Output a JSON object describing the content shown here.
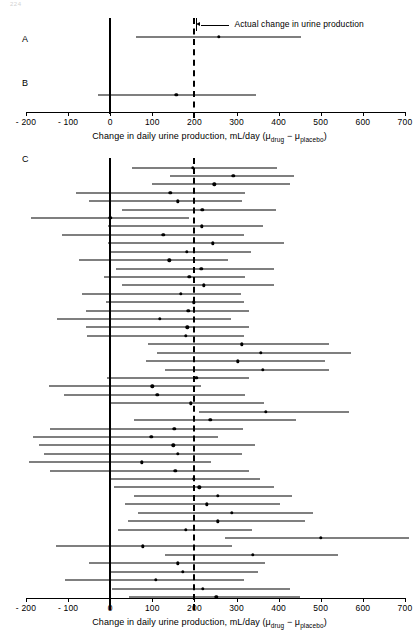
{
  "page": {
    "number": "224"
  },
  "axis": {
    "title_main": "Change in daily urine production, mL/day (",
    "title_mu1": "μ",
    "title_sub1": "drug",
    "title_minus": " − ",
    "title_mu2": "μ",
    "title_sub2": "placebo",
    "title_close": ")",
    "min": -200,
    "max": 700,
    "ticks": [
      -200,
      -100,
      0,
      100,
      200,
      300,
      400,
      500,
      600,
      700
    ],
    "tick_labels": [
      "- 200",
      "- 100",
      "0",
      "100",
      "200",
      "300",
      "400",
      "500",
      "600",
      "700"
    ],
    "unit": "mL/day"
  },
  "reference_lines": {
    "zero_value": 0,
    "zero_style": "solid",
    "true_value": 200,
    "true_style": "dashed"
  },
  "annotation": {
    "label": "Actual change in urine production",
    "points_to": 200
  },
  "panels": [
    {
      "id": "A",
      "label": "A"
    },
    {
      "id": "B",
      "label": "B"
    },
    {
      "id": "C",
      "label": "C"
    }
  ],
  "chart_data": {
    "type": "scatter",
    "title": "",
    "xlabel": "Change in daily urine production, mL/day (μ_drug − μ_placebo)",
    "ylabel": "",
    "xlim": [
      -200,
      700
    ],
    "grid": false,
    "legend": "none",
    "reference_line_solid": 0,
    "reference_line_dashed": 200,
    "annotation_text": "Actual change in urine production",
    "panels": [
      {
        "panel": "A",
        "note": "single sample confidence interval",
        "intervals": [
          {
            "mean": 258,
            "low": 62,
            "high": 452
          }
        ]
      },
      {
        "panel": "B",
        "note": "single sample confidence interval",
        "intervals": [
          {
            "mean": 157,
            "low": -28,
            "high": 346
          }
        ]
      },
      {
        "panel": "C",
        "note": "many repeated samples, each 95% confidence interval",
        "intervals": [
          {
            "mean": 196,
            "low": 52,
            "high": 396
          },
          {
            "mean": 292,
            "low": 142,
            "high": 436
          },
          {
            "mean": 247,
            "low": 100,
            "high": 428
          },
          {
            "mean": 143,
            "low": -82,
            "high": 320
          },
          {
            "mean": 160,
            "low": -50,
            "high": 312
          },
          {
            "mean": 219,
            "low": 28,
            "high": 394
          },
          {
            "mean": 0,
            "low": -188,
            "high": 186
          },
          {
            "mean": 217,
            "low": -6,
            "high": 364
          },
          {
            "mean": 126,
            "low": -115,
            "high": 318
          },
          {
            "mean": 244,
            "low": -6,
            "high": 412
          },
          {
            "mean": 182,
            "low": 0,
            "high": 335
          },
          {
            "mean": 140,
            "low": -74,
            "high": 280
          },
          {
            "mean": 216,
            "low": 13,
            "high": 390
          },
          {
            "mean": 188,
            "low": -15,
            "high": 320
          },
          {
            "mean": 222,
            "low": 29,
            "high": 388
          },
          {
            "mean": 168,
            "low": -66,
            "high": 310
          },
          {
            "mean": 199,
            "low": -11,
            "high": 318
          },
          {
            "mean": 185,
            "low": -58,
            "high": 330
          },
          {
            "mean": 118,
            "low": -126,
            "high": 288
          },
          {
            "mean": 183,
            "low": -58,
            "high": 330
          },
          {
            "mean": 180,
            "low": -56,
            "high": 318
          },
          {
            "mean": 312,
            "low": 90,
            "high": 520
          },
          {
            "mean": 358,
            "low": 110,
            "high": 572
          },
          {
            "mean": 303,
            "low": 85,
            "high": 510
          },
          {
            "mean": 362,
            "low": 130,
            "high": 520
          },
          {
            "mean": 204,
            "low": -7,
            "high": 330
          },
          {
            "mean": 100,
            "low": -145,
            "high": 216
          },
          {
            "mean": 112,
            "low": -110,
            "high": 320
          },
          {
            "mean": 192,
            "low": -4,
            "high": 366
          },
          {
            "mean": 370,
            "low": 212,
            "high": 566
          },
          {
            "mean": 238,
            "low": 56,
            "high": 440
          },
          {
            "mean": 152,
            "low": -142,
            "high": 316
          },
          {
            "mean": 98,
            "low": -184,
            "high": 256
          },
          {
            "mean": 150,
            "low": -168,
            "high": 344
          },
          {
            "mean": 160,
            "low": -158,
            "high": 312
          },
          {
            "mean": 75,
            "low": -192,
            "high": 240
          },
          {
            "mean": 155,
            "low": -142,
            "high": 330
          },
          {
            "mean": 198,
            "low": -4,
            "high": 356
          },
          {
            "mean": 212,
            "low": 8,
            "high": 390
          },
          {
            "mean": 256,
            "low": 56,
            "high": 432
          },
          {
            "mean": 230,
            "low": 36,
            "high": 404
          },
          {
            "mean": 288,
            "low": 66,
            "high": 482
          },
          {
            "mean": 256,
            "low": 42,
            "high": 462
          },
          {
            "mean": 179,
            "low": 18,
            "high": 336
          },
          {
            "mean": 500,
            "low": 272,
            "high": 710
          },
          {
            "mean": 78,
            "low": -128,
            "high": 290
          },
          {
            "mean": 338,
            "low": 130,
            "high": 540
          },
          {
            "mean": 160,
            "low": -50,
            "high": 368
          },
          {
            "mean": 172,
            "low": -2,
            "high": 352
          },
          {
            "mean": 108,
            "low": -108,
            "high": 318
          },
          {
            "mean": 220,
            "low": 4,
            "high": 428
          },
          {
            "mean": 252,
            "low": 44,
            "high": 450
          }
        ]
      }
    ]
  }
}
